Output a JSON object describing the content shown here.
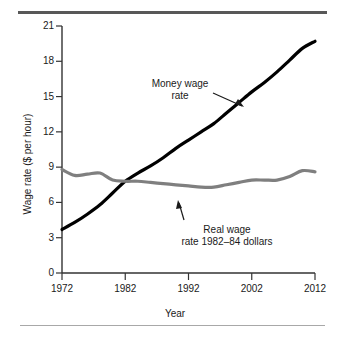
{
  "figure": {
    "background": "#ffffff",
    "rule_top_color": "#585858",
    "rule_bottom_color": "#a8a8a8"
  },
  "chart_data": {
    "type": "line",
    "title": "",
    "xlabel": "Year",
    "ylabel": "Wage rate ($ per hour)",
    "xlim": [
      1972,
      2012
    ],
    "ylim": [
      0,
      21
    ],
    "xticks": [
      "1972",
      "1982",
      "1992",
      "2002",
      "2012"
    ],
    "yticks": [
      "0",
      "3",
      "6",
      "9",
      "12",
      "15",
      "18",
      "21"
    ],
    "grid": false,
    "legend_position": "annotations-inline",
    "annotations": [
      {
        "name": "money-wage-annotation",
        "line1": "Money wage",
        "line2": "rate",
        "points_to_series": "Money wage rate",
        "arrow": "down-right"
      },
      {
        "name": "real-wage-annotation",
        "line1": "Real wage",
        "line2": "rate 1982–84 dollars",
        "points_to_series": "Real wage rate 1982-84 dollars",
        "arrow": "up"
      }
    ],
    "series": [
      {
        "name": "Money wage rate",
        "color": "#000000",
        "width": 3.2,
        "x": [
          1972,
          1974,
          1976,
          1978,
          1980,
          1982,
          1984,
          1986,
          1988,
          1990,
          1992,
          1994,
          1996,
          1998,
          2000,
          2002,
          2004,
          2006,
          2008,
          2010,
          2012
        ],
        "values": [
          3.7,
          4.3,
          5.0,
          5.8,
          6.8,
          7.8,
          8.5,
          9.1,
          9.8,
          10.6,
          11.3,
          12.0,
          12.7,
          13.6,
          14.5,
          15.4,
          16.2,
          17.1,
          18.1,
          19.1,
          19.7
        ]
      },
      {
        "name": "Real wage rate 1982-84 dollars",
        "color": "#7f7f7f",
        "width": 3.2,
        "x": [
          1972,
          1974,
          1976,
          1978,
          1980,
          1982,
          1984,
          1986,
          1988,
          1990,
          1992,
          1994,
          1996,
          1998,
          2000,
          2002,
          2004,
          2006,
          2008,
          2010,
          2012
        ],
        "values": [
          8.8,
          8.3,
          8.4,
          8.5,
          7.9,
          7.8,
          7.8,
          7.7,
          7.6,
          7.5,
          7.4,
          7.3,
          7.3,
          7.5,
          7.7,
          7.9,
          7.9,
          7.9,
          8.2,
          8.7,
          8.6
        ]
      }
    ]
  }
}
